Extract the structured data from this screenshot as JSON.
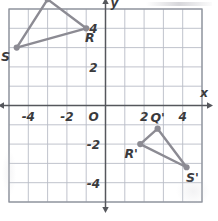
{
  "figure": {
    "colors": {
      "grid_line": "#b9bcc6",
      "grid_border": "#8e929c",
      "axis": "#55575c",
      "shape_stroke": "#8c8b93",
      "shape_vertex": "#8c8b93",
      "label_text": "#3a3a3c",
      "background": "#ffffff"
    },
    "grid": {
      "x_min": -5,
      "x_max": 5,
      "y_min": -5,
      "y_max": 5,
      "cell_units": 1,
      "units_per_label": 2,
      "show_grid": true
    },
    "axes": {
      "x_label": "x",
      "y_label": "y",
      "origin_label": "O",
      "x_ticks": [
        "-4",
        "-2",
        "2",
        "4"
      ],
      "y_ticks": [
        "4",
        "2",
        "-2",
        "-4"
      ]
    },
    "shapes": [
      {
        "name": "triangle-QRS",
        "vertices": [
          {
            "label": "Q",
            "x": -3.0,
            "y": 5.5,
            "label_dx": -0.25,
            "label_dy": 0.95
          },
          {
            "label": "R",
            "x": -1.0,
            "y": 4.0,
            "label_dx": 0.35,
            "label_dy": -0.95
          },
          {
            "label": "S",
            "x": -4.6,
            "y": 3.0,
            "label_dx": -1.05,
            "label_dy": -0.85
          }
        ]
      },
      {
        "name": "triangle-Q-prime-R-prime-S-prime",
        "vertices": [
          {
            "label": "Q'",
            "x": 2.7,
            "y": -1.2,
            "label_dx": 0.0,
            "label_dy": 1.05
          },
          {
            "label": "R'",
            "x": 1.8,
            "y": -2.0,
            "label_dx": -0.85,
            "label_dy": -0.95
          },
          {
            "label": "S'",
            "x": 4.2,
            "y": -3.2,
            "label_dx": 0.55,
            "label_dy": -1.05
          }
        ]
      }
    ]
  },
  "chart_data": {
    "type": "scatter",
    "xlabel": "x",
    "ylabel": "y",
    "xlim": [
      -5,
      5
    ],
    "ylim": [
      -5,
      5
    ],
    "grid": true,
    "legend": "none",
    "xticks": [
      -4,
      -2,
      2,
      4
    ],
    "yticks": [
      4,
      2,
      -2,
      -4
    ],
    "series": [
      {
        "name": "Triangle QRS",
        "point_labels": [
          "Q",
          "R",
          "S"
        ],
        "x": [
          -3.0,
          -1.0,
          -4.6
        ],
        "y": [
          5.5,
          4.0,
          3.0
        ],
        "closed": true
      },
      {
        "name": "Triangle Q'R'S'",
        "point_labels": [
          "Q'",
          "R'",
          "S'"
        ],
        "x": [
          2.7,
          1.8,
          4.2
        ],
        "y": [
          -1.2,
          -2.0,
          -3.2
        ],
        "closed": true
      }
    ]
  }
}
